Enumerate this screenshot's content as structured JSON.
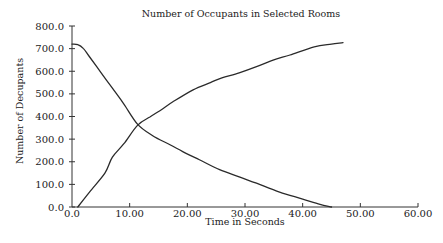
{
  "chart_data": {
    "type": "line",
    "title": "Number of Occupants in Selected Rooms",
    "xlabel": "Time in Seconds",
    "ylabel": "Number of Decupants",
    "xlim": [
      0,
      60
    ],
    "ylim": [
      0,
      800
    ],
    "x_ticks": [
      0,
      10,
      20,
      30,
      40,
      50,
      60
    ],
    "x_tick_labels": [
      "0.0",
      "10.00",
      "20.00",
      "30.00",
      "40.00",
      "50.00",
      "60.00"
    ],
    "y_ticks": [
      0,
      100,
      200,
      300,
      400,
      500,
      600,
      700,
      800
    ],
    "y_tick_labels": [
      "0.0",
      "100.0",
      "200.0",
      "300.0",
      "400.0",
      "500.0",
      "600.0",
      "700.0",
      "800.0"
    ],
    "grid": false,
    "legend": "none",
    "series": [
      {
        "name": "Decreasing occupants",
        "color": "#2a2a2a",
        "points": [
          [
            0,
            720
          ],
          [
            1,
            718
          ],
          [
            2,
            700
          ],
          [
            3,
            665
          ],
          [
            5,
            595
          ],
          [
            7,
            525
          ],
          [
            9,
            455
          ],
          [
            11.4,
            365
          ],
          [
            14,
            315
          ],
          [
            17,
            275
          ],
          [
            19.2,
            245
          ],
          [
            22,
            210
          ],
          [
            25.6,
            165
          ],
          [
            29,
            133
          ],
          [
            32,
            105
          ],
          [
            36,
            66
          ],
          [
            40,
            35
          ],
          [
            43,
            12
          ],
          [
            45,
            0
          ]
        ]
      },
      {
        "name": "Increasing occupants",
        "color": "#2a2a2a",
        "points": [
          [
            1,
            0
          ],
          [
            3,
            65
          ],
          [
            5.7,
            150
          ],
          [
            7,
            220
          ],
          [
            9,
            280
          ],
          [
            11.4,
            362
          ],
          [
            13.5,
            398
          ],
          [
            15.5,
            430
          ],
          [
            17.5,
            465
          ],
          [
            21,
            518
          ],
          [
            24,
            550
          ],
          [
            26,
            571
          ],
          [
            29,
            593
          ],
          [
            32,
            620
          ],
          [
            35,
            650
          ],
          [
            37.8,
            672
          ],
          [
            42,
            708
          ],
          [
            45,
            720
          ],
          [
            47,
            726
          ]
        ]
      }
    ]
  }
}
